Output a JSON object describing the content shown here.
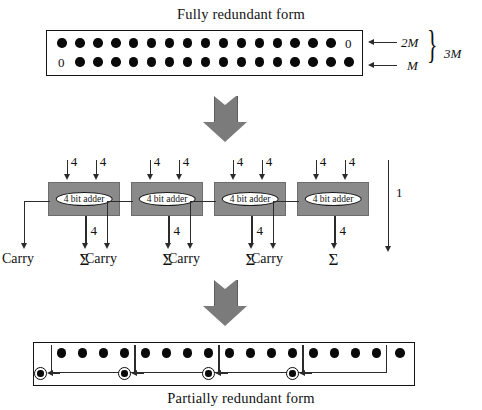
{
  "figure": {
    "top_caption": "Fully redundant form",
    "bottom_caption": "Partially redundant form"
  },
  "fully_redundant": {
    "rows": [
      {
        "name": "upper-row",
        "leading_zero": "",
        "trailing_zero": "0",
        "dot_count": 16,
        "weight_label": "2M"
      },
      {
        "name": "lower-row",
        "leading_zero": "0",
        "trailing_zero": "",
        "dot_count": 16,
        "weight_label": "M"
      }
    ],
    "total_label": "3M"
  },
  "adder_stage": {
    "input_width_label": "4",
    "output_width_label": "4",
    "passthrough_label": "1",
    "carry_label": "Carry",
    "sum_label": "Σ",
    "blocks": [
      {
        "label": "4 bit adder"
      },
      {
        "label": "4 bit adder"
      },
      {
        "label": "4 bit adder"
      },
      {
        "label": "4 bit adder"
      }
    ]
  },
  "partially_redundant": {
    "groups": [
      {
        "dot_count": 4
      },
      {
        "dot_count": 4
      },
      {
        "dot_count": 4
      },
      {
        "dot_count": 4
      }
    ],
    "extra_dot_count": 1,
    "carry_marker_count": 4
  },
  "colors": {
    "adder_fill": "#8a8a8a",
    "fat_arrow": "#7b7b7b",
    "ink": "#111111"
  }
}
